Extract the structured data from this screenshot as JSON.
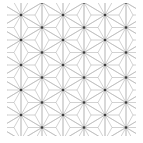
{
  "pattern": {
    "name": "asanoha",
    "description": "Hemp-leaf geometric pattern",
    "bounds": {
      "x0": 7,
      "y0": 3,
      "x1": 136,
      "y1": 136
    },
    "origin": {
      "x": 21,
      "y": 15
    },
    "col_step": 21,
    "row_step": 12.5,
    "line_color": "#b4b4b4",
    "node_color": "#3a3a3a",
    "background": "#ffffff"
  }
}
